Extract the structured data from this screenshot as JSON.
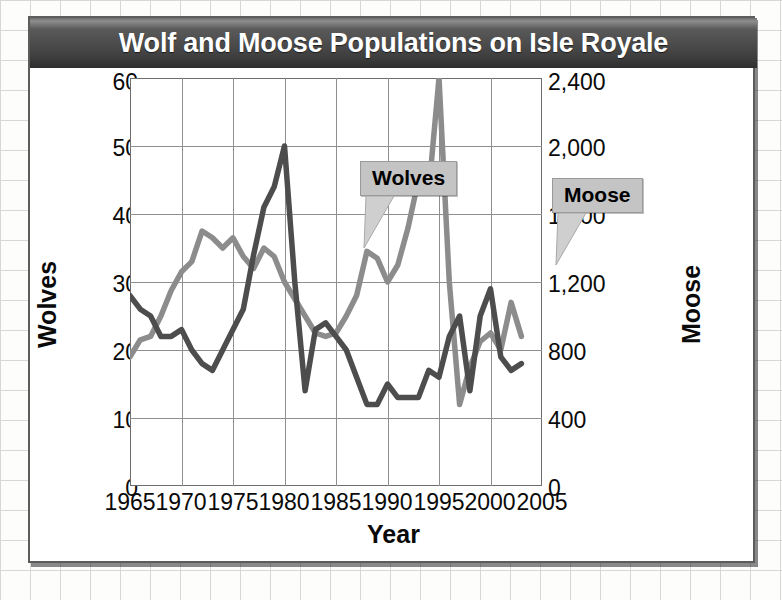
{
  "figure": {
    "title": "Wolf and Moose Populations on Isle Royale"
  },
  "chart_data": {
    "type": "line",
    "title": "Wolf and Moose Populations on Isle Royale",
    "xlabel": "Year",
    "ylabel": "Wolves",
    "ylabel_right": "Moose",
    "xlim": [
      1965,
      2005
    ],
    "ylim": [
      0,
      60
    ],
    "ylim_right": [
      0,
      2400
    ],
    "grid": true,
    "legend_position": "inline-callouts",
    "xticks": [
      "1965",
      "1970",
      "1975",
      "1980",
      "1985",
      "1990",
      "1995",
      "2000",
      "2005"
    ],
    "yticks_left": [
      "60",
      "50",
      "40",
      "30",
      "20",
      "10",
      "0"
    ],
    "yticks_right": [
      "2,400",
      "2,000",
      "1,600",
      "1,200",
      "800",
      "400",
      "0"
    ],
    "x": [
      1965,
      1966,
      1967,
      1968,
      1969,
      1970,
      1971,
      1972,
      1973,
      1974,
      1975,
      1976,
      1977,
      1978,
      1979,
      1980,
      1981,
      1982,
      1983,
      1984,
      1985,
      1986,
      1987,
      1988,
      1989,
      1990,
      1991,
      1992,
      1993,
      1994,
      1995,
      1996,
      1997,
      1998,
      1999,
      2000,
      2001,
      2002,
      2003
    ],
    "series": [
      {
        "name": "Wolves",
        "axis": "left",
        "color": "#4d4d4d",
        "values": [
          28,
          26,
          25,
          22,
          22,
          23,
          20,
          18,
          17,
          20,
          23,
          26,
          34,
          41,
          44,
          50,
          30,
          14,
          23,
          24,
          22,
          20,
          16,
          12,
          12,
          15,
          13,
          13,
          13,
          17,
          16,
          22,
          25,
          14,
          25,
          29,
          19,
          17,
          18
        ]
      },
      {
        "name": "Moose",
        "axis": "right",
        "color": "#8c8c8c",
        "values": [
          760,
          860,
          880,
          1000,
          1150,
          1260,
          1320,
          1500,
          1460,
          1400,
          1460,
          1350,
          1280,
          1400,
          1350,
          1200,
          1100,
          1000,
          900,
          880,
          900,
          1000,
          1120,
          1380,
          1340,
          1200,
          1300,
          1520,
          1800,
          1730,
          2400,
          1200,
          480,
          700,
          850,
          900,
          800,
          1080,
          880
        ]
      }
    ],
    "annotations": [
      {
        "label": "Wolves",
        "points_to": "wolves-line"
      },
      {
        "label": "Moose",
        "points_to": "moose-line"
      }
    ]
  },
  "labels": {
    "y_left_title": "Wolves",
    "y_right_title": "Moose",
    "x_title": "Year"
  },
  "colors": {
    "wolves_line": "#4d4d4d",
    "moose_line": "#8c8c8c",
    "grid": "#8f8f8f",
    "title_bar_dark": "#3d3d3d",
    "callout_fill": "#c4c4c4"
  }
}
